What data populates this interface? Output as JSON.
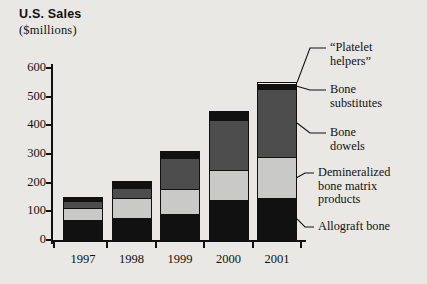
{
  "title": {
    "main": "U.S. Sales",
    "sub": "($millions)"
  },
  "chart_data": {
    "type": "bar",
    "subtype": "stacked-bar",
    "title": "U.S. Sales ($millions)",
    "xlabel": "",
    "ylabel": "U.S. Sales ($millions)",
    "ylim": [
      0,
      600
    ],
    "yticks": [
      0,
      100,
      200,
      300,
      400,
      500,
      600
    ],
    "ytick_labels": [
      "0",
      "100",
      "200",
      "300",
      "400",
      "500",
      "600"
    ],
    "grid": false,
    "legend_position": "right-callouts",
    "categories": [
      "1997",
      "1998",
      "1999",
      "2000",
      "2001"
    ],
    "series": [
      {
        "name": "Allograft bone",
        "color": "#111111",
        "values": [
          70,
          78,
          92,
          140,
          148
        ]
      },
      {
        "name": "Demineralized bone matrix products",
        "color": "#c9c9c7",
        "values": [
          40,
          67,
          87,
          105,
          140
        ]
      },
      {
        "name": "Bone dowels",
        "color": "#4d4d4d",
        "values": [
          26,
          38,
          108,
          172,
          240
        ]
      },
      {
        "name": "Bone substitutes",
        "color": "#111111",
        "values": [
          14,
          22,
          23,
          33,
          17
        ]
      },
      {
        "name": "“Platelet helpers”",
        "color": "#f2f1ed",
        "values": [
          0,
          0,
          0,
          0,
          8
        ]
      }
    ],
    "totals": [
      150,
      205,
      310,
      450,
      553
    ],
    "annotations": [
      {
        "label": "“Platelet\nhelpers”",
        "target_series": "“Platelet helpers”"
      },
      {
        "label": "Bone\nsubstitutes",
        "target_series": "Bone substitutes"
      },
      {
        "label": "Bone\ndowels",
        "target_series": "Bone dowels"
      },
      {
        "label": "Demineralized\nbone matrix\nproducts",
        "target_series": "Demineralized bone matrix products"
      },
      {
        "label": "Allograft bone",
        "target_series": "Allograft bone"
      }
    ]
  },
  "colors": {
    "background": "#e9e8e4",
    "ink": "#111111",
    "dark_gray": "#4d4d4d",
    "light_gray": "#c9c9c7",
    "white_seg": "#f2f1ed"
  }
}
